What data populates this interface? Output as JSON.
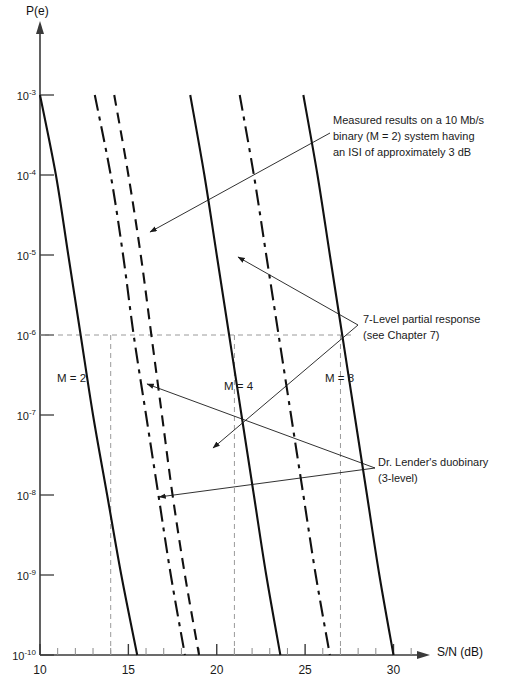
{
  "chart_data": {
    "type": "line",
    "title": "",
    "xlabel": "S/N (dB)",
    "ylabel": "P(e)",
    "xlim": [
      10,
      31.5
    ],
    "ylim_exponents": [
      -10,
      -3
    ],
    "grid": false,
    "legend_position": "inline-annotations",
    "xticks": [
      10,
      15,
      20,
      25,
      30
    ],
    "xtick_labels": [
      "10",
      "15",
      "20",
      "25",
      "30"
    ],
    "xminor_ticks": [
      11,
      12,
      13,
      14,
      16,
      17,
      18,
      19,
      21,
      22,
      23,
      24,
      26,
      27,
      28,
      29,
      31
    ],
    "ytick_labels": [
      "10-3",
      "10-4",
      "10-5",
      "10-6",
      "10-7",
      "10-8",
      "10-9",
      "10-10"
    ],
    "ytick_mantissa": "10",
    "ytick_exponents": [
      "-3",
      "-4",
      "-5",
      "-6",
      "-7",
      "-8",
      "-9",
      "-10"
    ],
    "reference_line_y": "1e-6",
    "reference_drops_x": [
      14,
      21,
      27
    ],
    "series": [
      {
        "name": "M = 2",
        "style": "solid",
        "label": "M = 2",
        "points": [
          [
            10.0,
            -3.0
          ],
          [
            10.9,
            -4.0
          ],
          [
            11.6,
            -5.0
          ],
          [
            12.3,
            -6.0
          ],
          [
            13.0,
            -7.0
          ],
          [
            13.8,
            -8.0
          ],
          [
            14.6,
            -9.0
          ],
          [
            15.5,
            -10.0
          ]
        ]
      },
      {
        "name": "duobinary-3-level-A",
        "style": "dash-dot",
        "label": "Dr. Lender's duobinary (3-level)",
        "points": [
          [
            13.1,
            -3.0
          ],
          [
            14.0,
            -4.0
          ],
          [
            14.7,
            -5.0
          ],
          [
            15.3,
            -6.0
          ],
          [
            16.0,
            -7.0
          ],
          [
            16.7,
            -8.0
          ],
          [
            17.4,
            -9.0
          ],
          [
            18.2,
            -10.0
          ]
        ]
      },
      {
        "name": "duobinary-3-level-B",
        "style": "dashed",
        "label": "Dr. Lender's duobinary (3-level)",
        "points": [
          [
            14.2,
            -3.0
          ],
          [
            15.0,
            -4.0
          ],
          [
            15.7,
            -5.0
          ],
          [
            16.3,
            -6.0
          ],
          [
            16.9,
            -7.0
          ],
          [
            17.5,
            -8.0
          ],
          [
            18.2,
            -9.0
          ],
          [
            19.0,
            -10.0
          ]
        ]
      },
      {
        "name": "M = 4",
        "style": "solid",
        "label": "M = 4",
        "points": [
          [
            18.5,
            -3.0
          ],
          [
            19.3,
            -4.0
          ],
          [
            20.0,
            -5.0
          ],
          [
            20.7,
            -6.0
          ],
          [
            21.4,
            -7.0
          ],
          [
            22.1,
            -8.0
          ],
          [
            22.8,
            -9.0
          ],
          [
            23.6,
            -10.0
          ]
        ]
      },
      {
        "name": "7-level-partial-response",
        "style": "dash-dot",
        "label": "7-Level partial response (see Chapter 7)",
        "points": [
          [
            21.3,
            -3.0
          ],
          [
            22.1,
            -4.0
          ],
          [
            22.8,
            -5.0
          ],
          [
            23.5,
            -6.0
          ],
          [
            24.2,
            -7.0
          ],
          [
            24.9,
            -8.0
          ],
          [
            25.6,
            -9.0
          ],
          [
            26.4,
            -10.0
          ]
        ]
      },
      {
        "name": "M = 8",
        "style": "solid",
        "label": "M = 8",
        "points": [
          [
            24.9,
            -3.0
          ],
          [
            25.7,
            -4.0
          ],
          [
            26.4,
            -5.0
          ],
          [
            27.1,
            -6.0
          ],
          [
            27.8,
            -7.0
          ],
          [
            28.5,
            -8.0
          ],
          [
            29.2,
            -9.0
          ],
          [
            30.0,
            -10.0
          ]
        ]
      }
    ],
    "annotations": [
      {
        "id": "measured-results",
        "text": "Measured results on a 10 Mb/s\nbinary (M = 2) system having\nan ISI of approximately 3 dB"
      },
      {
        "id": "partial-response",
        "text": "7-Level partial response\n(see Chapter 7)"
      },
      {
        "id": "duobinary",
        "text": "Dr. Lender's duobinary\n(3-level)"
      }
    ],
    "inline_labels": [
      {
        "id": "m2",
        "text": "M = 2"
      },
      {
        "id": "m4",
        "text": "M = 4"
      },
      {
        "id": "m8",
        "text": "M = 8"
      }
    ]
  },
  "colors": {
    "ink": "#111111",
    "axis": "#3a3a3a",
    "dashed_guide": "#9a9a9a"
  }
}
